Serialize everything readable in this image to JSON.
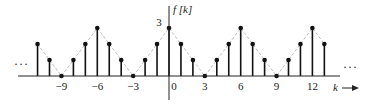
{
  "chart_data": {
    "type": "stem",
    "title": "",
    "xlabel": "k",
    "ylabel": "f [k]",
    "x": [
      -11,
      -10,
      -9,
      -8,
      -7,
      -6,
      -5,
      -4,
      -3,
      -2,
      -1,
      0,
      1,
      2,
      3,
      4,
      5,
      6,
      7,
      8,
      9,
      10,
      11,
      12,
      13
    ],
    "values": [
      2,
      1,
      0,
      1,
      2,
      3,
      2,
      1,
      0,
      1,
      2,
      3,
      2,
      1,
      0,
      1,
      2,
      3,
      2,
      1,
      0,
      1,
      2,
      3,
      2
    ],
    "x_tick_labels": [
      "−9",
      "−6",
      "−3",
      "0",
      "3",
      "6",
      "9",
      "12"
    ],
    "x_tick_values": [
      -9,
      -6,
      -3,
      0,
      3,
      6,
      9,
      12
    ],
    "y_tick_labels": [
      "3"
    ],
    "y_tick_values": [
      3
    ],
    "ylim": [
      0,
      3
    ],
    "period": 6,
    "envelope": "dashed triangular",
    "continuation_marks": [
      "…",
      "…"
    ],
    "grid": false,
    "legend": null
  },
  "labels": {
    "ylabel": "f [k]",
    "xlabel": "k",
    "left_ellipsis": "···",
    "right_ellipsis": "···",
    "peak_value": "3"
  },
  "colors": {
    "stem": "#111111",
    "envelope": "#bdbdbd",
    "axis": "#222222"
  }
}
